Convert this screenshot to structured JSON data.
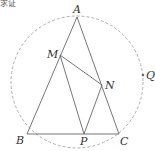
{
  "fragment_text": "求证",
  "diagram": {
    "type": "geometry",
    "points": {
      "A": {
        "label": "A",
        "x": 77,
        "y": 17
      },
      "B": {
        "label": "B",
        "x": 27,
        "y": 134
      },
      "C": {
        "label": "C",
        "x": 119,
        "y": 134
      },
      "M": {
        "label": "M",
        "x": 60,
        "y": 55
      },
      "N": {
        "label": "N",
        "x": 102,
        "y": 85
      },
      "P": {
        "label": "P",
        "x": 84,
        "y": 134
      },
      "Q": {
        "label": "Q",
        "x": 143,
        "y": 75
      }
    },
    "segments": [
      "AB",
      "AC",
      "BC",
      "MN",
      "MP",
      "NP"
    ],
    "circle": {
      "cx": 77,
      "cy": 82,
      "r": 66,
      "style": "dashed"
    },
    "colors": {
      "line": "#555555",
      "circle": "#888888",
      "label": "#333333"
    }
  }
}
